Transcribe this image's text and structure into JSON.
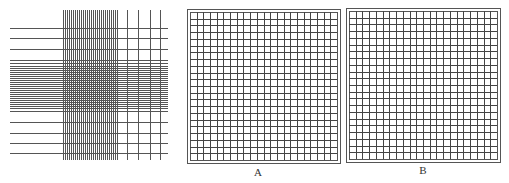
{
  "figure": {
    "line_color": "#444444",
    "dense_line_color": "#555555",
    "frame_color": "#555555",
    "background": "#ffffff"
  },
  "panels": [
    {
      "id": "uneven",
      "label": "",
      "horizontal_lines": {
        "x_start": 10,
        "x_end": 168,
        "y": [
          28,
          38,
          49,
          60,
          63,
          66,
          68,
          70,
          72,
          74,
          76,
          78,
          80,
          82,
          84,
          86,
          88,
          90,
          92,
          94,
          96,
          98,
          100,
          102,
          104,
          106,
          108,
          111,
          122,
          133,
          143,
          153
        ]
      },
      "vertical_lines": {
        "y_start": 10,
        "y_end": 160,
        "x": [
          63,
          65,
          67,
          69,
          71,
          73,
          75,
          77,
          79,
          81,
          83,
          85,
          87,
          89,
          91,
          93,
          95,
          97,
          99,
          101,
          103,
          105,
          107,
          109,
          111,
          113,
          115,
          117,
          127,
          138,
          150,
          160
        ]
      }
    },
    {
      "id": "A",
      "label": "A",
      "frame": {
        "x": 187,
        "y": 9,
        "w": 153,
        "h": 154,
        "inner_offset": 3
      },
      "grid_divisions": 22,
      "label_pos": {
        "x": 258,
        "y": 166
      }
    },
    {
      "id": "B",
      "label": "B",
      "frame": {
        "x": 346,
        "y": 8,
        "w": 154,
        "h": 154,
        "inner_offset": 3
      },
      "grid_divisions": 22,
      "label_pos": {
        "x": 423,
        "y": 164
      }
    }
  ]
}
